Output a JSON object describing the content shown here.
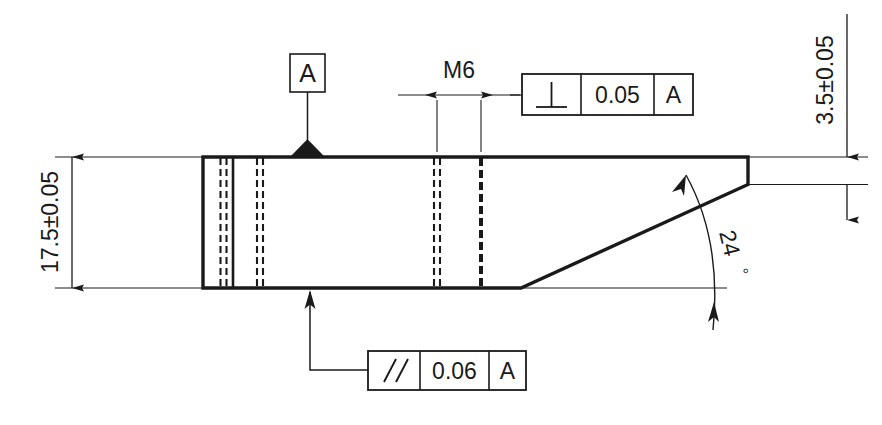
{
  "drawing": {
    "title": "Machined part orthographic section view",
    "background_color": "#ffffff",
    "line_color": "#1a1a1a",
    "dimensions": {
      "height_left": {
        "label": "17.5±0.05",
        "nominal": 17.5,
        "tolerance": 0.05,
        "orientation": "vertical"
      },
      "height_right": {
        "label": "3.5±0.05",
        "nominal": 3.5,
        "tolerance": 0.05,
        "orientation": "vertical"
      },
      "thread": {
        "label": "M6",
        "orientation": "horizontal"
      },
      "angle": {
        "label": "24",
        "unit_symbol": "°",
        "value": 24,
        "orientation": "rotated"
      }
    },
    "datum": {
      "label": "A",
      "symbol": "filled-triangle"
    },
    "feature_control_frames": [
      {
        "name": "perpendicularity",
        "symbol": "⊥",
        "tolerance": "0.05",
        "datum": "A",
        "position": "top-right"
      },
      {
        "name": "parallelism",
        "symbol": "//",
        "tolerance": "0.06",
        "datum": "A",
        "position": "bottom"
      }
    ]
  }
}
